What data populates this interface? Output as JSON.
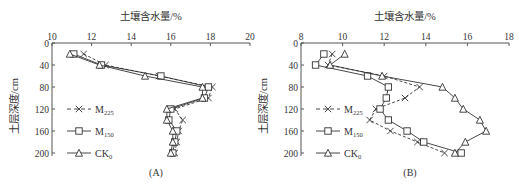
{
  "chart_data": [
    {
      "type": "line",
      "panel_label": "(A)",
      "title": "",
      "xlabel": "土壤含水量/%",
      "ylabel": "土层深度/cm",
      "xlim": [
        10,
        20
      ],
      "ylim": [
        0,
        200
      ],
      "y_inverted": true,
      "x_axis_position": "top",
      "x_ticks": [
        10,
        12,
        14,
        16,
        18,
        20
      ],
      "y_ticks": [
        0,
        40,
        80,
        120,
        160,
        200
      ],
      "grid": false,
      "legend_position": "lower-left inside",
      "depths": [
        20,
        40,
        60,
        80,
        100,
        120,
        140,
        160,
        180,
        200
      ],
      "series": [
        {
          "name": "M225",
          "label_main": "M",
          "label_sub": "225",
          "marker": "x",
          "line": "dashed",
          "values": [
            11.6,
            12.7,
            15.4,
            18.1,
            17.9,
            16.2,
            16.6,
            16.4,
            16.3,
            16.2
          ]
        },
        {
          "name": "M150",
          "label_main": "M",
          "label_sub": "150",
          "marker": "square",
          "line": "solid",
          "values": [
            11.1,
            12.5,
            15.5,
            17.9,
            17.7,
            16.0,
            15.9,
            16.3,
            16.2,
            16.1
          ]
        },
        {
          "name": "CK0",
          "label_main": "CK",
          "label_sub": "0",
          "marker": "triangle",
          "line": "solid",
          "values": [
            10.9,
            12.4,
            14.7,
            17.6,
            17.6,
            15.8,
            15.8,
            16.1,
            16.1,
            16.0
          ]
        }
      ]
    },
    {
      "type": "line",
      "panel_label": "(B)",
      "title": "",
      "xlabel": "土壤含水量/%",
      "ylabel": "土层深度/cm",
      "xlim": [
        8,
        18
      ],
      "ylim": [
        0,
        200
      ],
      "y_inverted": true,
      "x_axis_position": "top",
      "x_ticks": [
        8,
        10,
        12,
        14,
        16,
        18
      ],
      "y_ticks": [
        0,
        40,
        80,
        120,
        160,
        200
      ],
      "grid": false,
      "legend_position": "lower-left inside",
      "depths": [
        20,
        40,
        60,
        80,
        100,
        120,
        140,
        160,
        180,
        200
      ],
      "series": [
        {
          "name": "M225",
          "label_main": "M",
          "label_sub": "225",
          "marker": "x",
          "line": "dashed",
          "values": [
            9.5,
            9.3,
            12.0,
            13.7,
            13.0,
            11.6,
            11.3,
            12.3,
            13.6,
            14.9
          ]
        },
        {
          "name": "M150",
          "label_main": "M",
          "label_sub": "150",
          "marker": "square",
          "line": "solid",
          "values": [
            9.1,
            8.7,
            11.2,
            12.2,
            12.1,
            11.8,
            12.2,
            13.1,
            13.9,
            15.7
          ]
        },
        {
          "name": "CK0",
          "label_main": "CK",
          "label_sub": "0",
          "marker": "triangle",
          "line": "solid",
          "values": [
            10.1,
            9.4,
            11.9,
            14.8,
            15.4,
            15.8,
            16.6,
            16.9,
            15.9,
            15.4
          ]
        }
      ]
    }
  ],
  "layout": {
    "panels": [
      {
        "x0": 52,
        "x1": 250,
        "y0": 43,
        "y1": 153
      },
      {
        "x0": 301,
        "x1": 509,
        "y0": 43,
        "y1": 153
      }
    ],
    "colors": {
      "axis": "#555555",
      "series": "#333333"
    }
  }
}
